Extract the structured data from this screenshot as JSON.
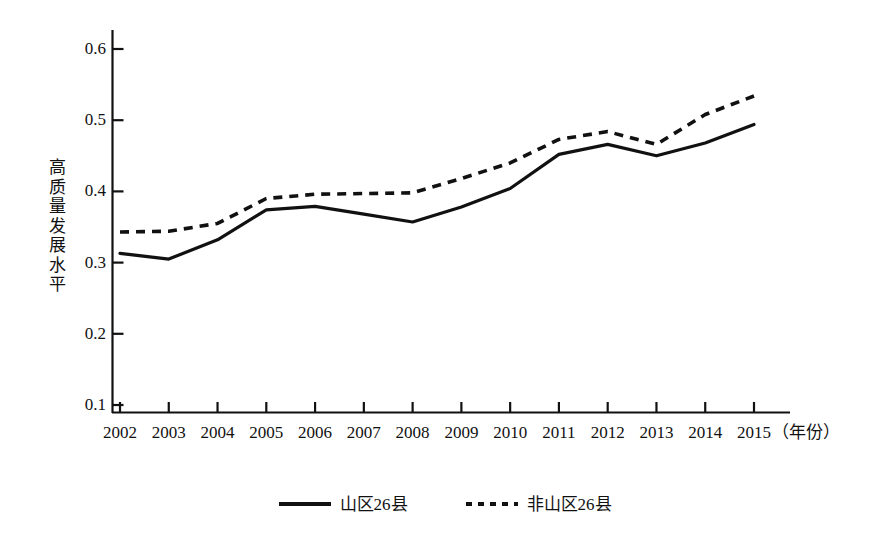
{
  "chart_data": {
    "type": "line",
    "title": "",
    "subtitle": "",
    "xlabel": "（年份）",
    "ylabel": "高质量发展水平",
    "x": [
      2002,
      2003,
      2004,
      2005,
      2006,
      2007,
      2008,
      2009,
      2010,
      2011,
      2012,
      2013,
      2014,
      2015
    ],
    "categories": [
      "2002",
      "2003",
      "2004",
      "2005",
      "2006",
      "2007",
      "2008",
      "2009",
      "2010",
      "2011",
      "2012",
      "2013",
      "2014",
      "2015"
    ],
    "xlim": [
      2002,
      2015
    ],
    "ylim": [
      0.1,
      0.63
    ],
    "ytick_values": [
      0.1,
      0.2,
      0.3,
      0.4,
      0.5,
      0.6
    ],
    "ytick_labels": [
      "0.1",
      "0.2",
      "0.3",
      "0.4",
      "0.5",
      "0.6"
    ],
    "grid": false,
    "legend_position": "bottom-center",
    "series": [
      {
        "name": "山区26县",
        "style": "solid",
        "color": "#111111",
        "values": [
          0.313,
          0.305,
          0.332,
          0.374,
          0.379,
          0.368,
          0.357,
          0.378,
          0.404,
          0.452,
          0.466,
          0.45,
          0.468,
          0.494
        ]
      },
      {
        "name": "非山区26县",
        "style": "dashed",
        "color": "#111111",
        "values": [
          0.343,
          0.344,
          0.355,
          0.39,
          0.396,
          0.397,
          0.398,
          0.418,
          0.44,
          0.473,
          0.484,
          0.466,
          0.508,
          0.534
        ]
      }
    ]
  },
  "legend": {
    "items": [
      {
        "label": "山区26县",
        "style": "solid"
      },
      {
        "label": "非山区26县",
        "style": "dashed"
      }
    ]
  }
}
